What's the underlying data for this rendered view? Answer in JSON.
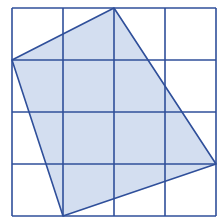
{
  "diagram": {
    "type": "grid-polygon",
    "grid": {
      "columns": 4,
      "rows": 4,
      "x_lines": [
        12,
        63,
        114,
        165,
        216
      ],
      "y_lines": [
        8,
        60,
        112,
        164,
        216
      ],
      "line_color": "#2f4f9a"
    },
    "polygon": {
      "vertices_grid": [
        [
          2,
          0
        ],
        [
          4,
          3
        ],
        [
          1,
          4
        ],
        [
          0,
          1
        ]
      ],
      "fill_color": "#d3def0",
      "stroke_color": "#2f4f9a"
    },
    "colors": {
      "background": "#ffffff",
      "grid": "#2f4f9a",
      "shape_fill": "#d3def0"
    }
  }
}
